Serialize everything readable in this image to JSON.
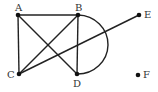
{
  "diagram": {
    "type": "graph",
    "colors": {
      "edge": "#222222",
      "node": "#111111",
      "label": "#333333",
      "background": "#ffffff"
    },
    "nodes": [
      {
        "id": "A",
        "label": "A",
        "x": 18,
        "y": 15,
        "lx": 15,
        "ly": 11
      },
      {
        "id": "B",
        "label": "B",
        "x": 78,
        "y": 15,
        "lx": 75,
        "ly": 11
      },
      {
        "id": "C",
        "label": "C",
        "x": 19,
        "y": 74,
        "lx": 7,
        "ly": 78
      },
      {
        "id": "D",
        "label": "D",
        "x": 77,
        "y": 74,
        "lx": 73,
        "ly": 87
      },
      {
        "id": "E",
        "label": "E",
        "x": 139,
        "y": 15,
        "lx": 144,
        "ly": 18
      },
      {
        "id": "F",
        "label": "F",
        "x": 138,
        "y": 75,
        "lx": 143,
        "ly": 78
      }
    ],
    "edges": [
      {
        "from": "A",
        "to": "B",
        "kind": "straight"
      },
      {
        "from": "A",
        "to": "C",
        "kind": "straight"
      },
      {
        "from": "A",
        "to": "D",
        "kind": "straight"
      },
      {
        "from": "B",
        "to": "C",
        "kind": "straight"
      },
      {
        "from": "B",
        "to": "D",
        "kind": "straight"
      },
      {
        "from": "B",
        "to": "D",
        "kind": "arc"
      },
      {
        "from": "C",
        "to": "E",
        "kind": "straight"
      }
    ]
  }
}
